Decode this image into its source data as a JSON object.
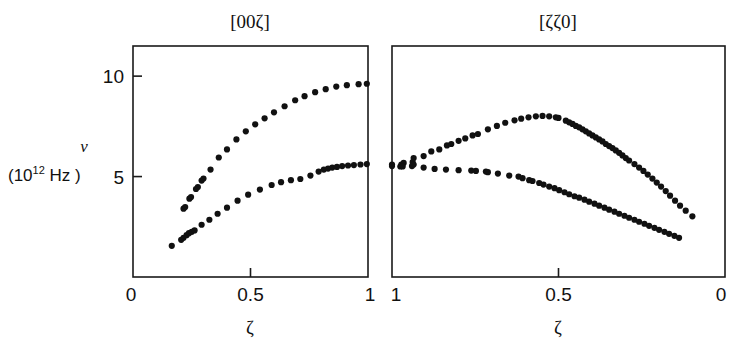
{
  "figure": {
    "y_axis_label_symbol": "ν",
    "y_axis_unit_open": "(10",
    "y_axis_unit_exp": "12",
    "y_axis_unit_close": " Hz )"
  },
  "chart_data": [
    {
      "type": "scatter",
      "title": "[00ζ]",
      "xlabel": "ζ",
      "ylabel": "ν (10^12 Hz)",
      "xlim": [
        0,
        1
      ],
      "ylim": [
        0,
        11.5
      ],
      "x_reversed": false,
      "xticks": [
        0,
        0.5,
        1
      ],
      "xticklabels": [
        "0",
        "0.5",
        "1"
      ],
      "yticks": [
        5,
        10
      ],
      "yticklabels": [
        "5",
        "10"
      ],
      "grid": false,
      "legend": "none",
      "series": [
        {
          "name": "longitudinal-acoustic-upper-branch",
          "points": [
            [
              0.215,
              3.4
            ],
            [
              0.222,
              3.48
            ],
            [
              0.24,
              3.9
            ],
            [
              0.247,
              3.98
            ],
            [
              0.268,
              4.38
            ],
            [
              0.276,
              4.48
            ],
            [
              0.292,
              4.8
            ],
            [
              0.3,
              4.9
            ],
            [
              0.33,
              5.35
            ],
            [
              0.365,
              5.95
            ],
            [
              0.4,
              6.35
            ],
            [
              0.44,
              6.85
            ],
            [
              0.48,
              7.25
            ],
            [
              0.52,
              7.6
            ],
            [
              0.56,
              7.9
            ],
            [
              0.6,
              8.2
            ],
            [
              0.645,
              8.5
            ],
            [
              0.69,
              8.8
            ],
            [
              0.73,
              9.0
            ],
            [
              0.775,
              9.2
            ],
            [
              0.82,
              9.35
            ],
            [
              0.865,
              9.48
            ],
            [
              0.91,
              9.55
            ],
            [
              0.96,
              9.6
            ],
            [
              0.995,
              9.62
            ]
          ]
        },
        {
          "name": "transverse-acoustic-lower-branch",
          "points": [
            [
              0.165,
              1.55
            ],
            [
              0.205,
              1.85
            ],
            [
              0.215,
              1.95
            ],
            [
              0.228,
              2.08
            ],
            [
              0.238,
              2.18
            ],
            [
              0.25,
              2.25
            ],
            [
              0.262,
              2.32
            ],
            [
              0.292,
              2.6
            ],
            [
              0.325,
              2.85
            ],
            [
              0.36,
              3.15
            ],
            [
              0.4,
              3.45
            ],
            [
              0.445,
              3.8
            ],
            [
              0.49,
              4.1
            ],
            [
              0.54,
              4.35
            ],
            [
              0.59,
              4.58
            ],
            [
              0.63,
              4.72
            ],
            [
              0.672,
              4.82
            ],
            [
              0.712,
              4.88
            ],
            [
              0.755,
              5.05
            ],
            [
              0.79,
              5.25
            ],
            [
              0.812,
              5.35
            ],
            [
              0.83,
              5.4
            ],
            [
              0.848,
              5.45
            ],
            [
              0.868,
              5.48
            ],
            [
              0.89,
              5.52
            ],
            [
              0.915,
              5.55
            ],
            [
              0.94,
              5.57
            ],
            [
              0.968,
              5.6
            ],
            [
              0.995,
              5.62
            ]
          ]
        }
      ]
    },
    {
      "type": "scatter",
      "title": "[ζζ0]",
      "xlabel": "ζ",
      "ylabel": "ν (10^12 Hz)",
      "xlim": [
        0,
        1
      ],
      "ylim": [
        0,
        11.5
      ],
      "x_reversed": true,
      "xticks": [
        1,
        0.5,
        0
      ],
      "xticklabels": [
        "1",
        "0.5",
        "0"
      ],
      "yticks": [
        5,
        10
      ],
      "yticklabels": [
        "5",
        "10"
      ],
      "grid": false,
      "legend": "none",
      "series": [
        {
          "name": "upper-branch",
          "points": [
            [
              1.0,
              5.6
            ],
            [
              0.972,
              5.6
            ],
            [
              0.965,
              5.68
            ],
            [
              0.938,
              5.72
            ],
            [
              0.935,
              5.92
            ],
            [
              0.905,
              6.02
            ],
            [
              0.882,
              6.25
            ],
            [
              0.858,
              6.35
            ],
            [
              0.835,
              6.55
            ],
            [
              0.822,
              6.62
            ],
            [
              0.8,
              6.78
            ],
            [
              0.78,
              6.9
            ],
            [
              0.758,
              7.05
            ],
            [
              0.742,
              7.12
            ],
            [
              0.712,
              7.35
            ],
            [
              0.685,
              7.52
            ],
            [
              0.66,
              7.68
            ],
            [
              0.632,
              7.8
            ],
            [
              0.612,
              7.88
            ],
            [
              0.59,
              7.95
            ],
            [
              0.568,
              8.0
            ],
            [
              0.548,
              8.02
            ],
            [
              0.528,
              8.0
            ],
            [
              0.508,
              7.95
            ],
            [
              0.5,
              7.92
            ],
            [
              0.478,
              7.78
            ],
            [
              0.468,
              7.7
            ],
            [
              0.458,
              7.62
            ],
            [
              0.448,
              7.52
            ],
            [
              0.438,
              7.45
            ],
            [
              0.428,
              7.35
            ],
            [
              0.418,
              7.25
            ],
            [
              0.408,
              7.15
            ],
            [
              0.398,
              7.05
            ],
            [
              0.388,
              6.95
            ],
            [
              0.378,
              6.85
            ],
            [
              0.368,
              6.75
            ],
            [
              0.358,
              6.62
            ],
            [
              0.348,
              6.52
            ],
            [
              0.338,
              6.42
            ],
            [
              0.328,
              6.3
            ],
            [
              0.318,
              6.18
            ],
            [
              0.308,
              6.05
            ],
            [
              0.298,
              5.92
            ],
            [
              0.288,
              5.8
            ],
            [
              0.272,
              5.62
            ],
            [
              0.258,
              5.45
            ],
            [
              0.245,
              5.28
            ],
            [
              0.232,
              5.1
            ],
            [
              0.218,
              4.9
            ],
            [
              0.205,
              4.7
            ],
            [
              0.192,
              4.5
            ],
            [
              0.178,
              4.28
            ],
            [
              0.165,
              4.05
            ],
            [
              0.15,
              3.8
            ],
            [
              0.135,
              3.55
            ],
            [
              0.118,
              3.3
            ],
            [
              0.098,
              3.02
            ]
          ]
        },
        {
          "name": "lower-branch",
          "points": [
            [
              1.0,
              5.52
            ],
            [
              0.975,
              5.5
            ],
            [
              0.968,
              5.5
            ],
            [
              0.94,
              5.52
            ],
            [
              0.935,
              5.6
            ],
            [
              0.905,
              5.45
            ],
            [
              0.872,
              5.38
            ],
            [
              0.838,
              5.35
            ],
            [
              0.8,
              5.32
            ],
            [
              0.762,
              5.3
            ],
            [
              0.748,
              5.28
            ],
            [
              0.718,
              5.25
            ],
            [
              0.712,
              5.22
            ],
            [
              0.682,
              5.15
            ],
            [
              0.648,
              5.05
            ],
            [
              0.62,
              5.0
            ],
            [
              0.608,
              4.92
            ],
            [
              0.588,
              4.82
            ],
            [
              0.578,
              4.78
            ],
            [
              0.558,
              4.68
            ],
            [
              0.545,
              4.6
            ],
            [
              0.528,
              4.5
            ],
            [
              0.512,
              4.42
            ],
            [
              0.498,
              4.32
            ],
            [
              0.482,
              4.22
            ],
            [
              0.468,
              4.12
            ],
            [
              0.452,
              4.02
            ],
            [
              0.438,
              3.95
            ],
            [
              0.422,
              3.85
            ],
            [
              0.408,
              3.75
            ],
            [
              0.392,
              3.65
            ],
            [
              0.378,
              3.55
            ],
            [
              0.362,
              3.45
            ],
            [
              0.348,
              3.35
            ],
            [
              0.332,
              3.25
            ],
            [
              0.318,
              3.15
            ],
            [
              0.302,
              3.05
            ],
            [
              0.288,
              2.95
            ],
            [
              0.272,
              2.85
            ],
            [
              0.258,
              2.75
            ],
            [
              0.242,
              2.65
            ],
            [
              0.228,
              2.55
            ],
            [
              0.212,
              2.45
            ],
            [
              0.198,
              2.35
            ],
            [
              0.182,
              2.25
            ],
            [
              0.168,
              2.15
            ],
            [
              0.152,
              2.05
            ],
            [
              0.138,
              1.95
            ]
          ]
        }
      ]
    }
  ]
}
